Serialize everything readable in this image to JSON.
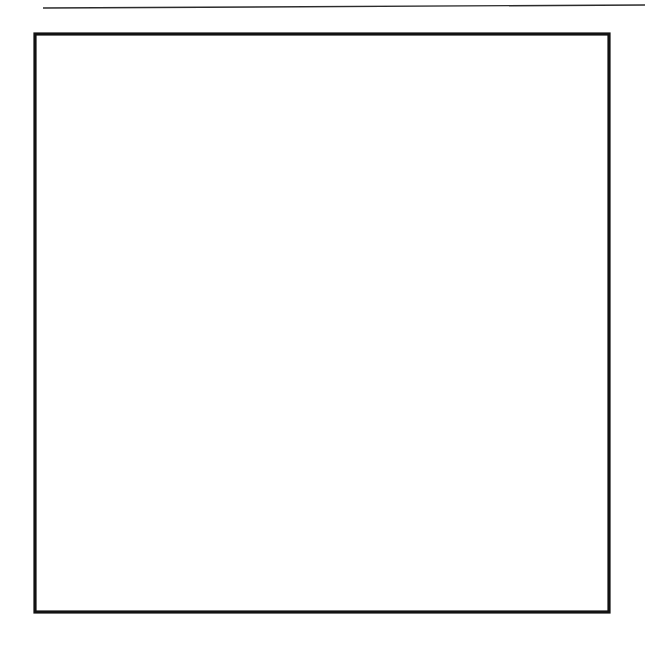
{
  "document": {
    "kind": "patent-style line drawing",
    "title": "Quilt block pattern diagram",
    "background_color": "#ffffff",
    "ink_color": "#111111"
  },
  "page_rule": {
    "name": "top horizontal rule",
    "x1": 43,
    "y1": 8,
    "x2": 645,
    "y2": 5,
    "color": "#2b2b2b"
  },
  "block": {
    "label": "quilt block",
    "x": 35,
    "y": 34,
    "width": 574,
    "height": 578,
    "outline_color": "#111111",
    "outline_width": 3.2,
    "columns": 4,
    "rows": 4
  },
  "grid": {
    "vertical_x": [
      178,
      320,
      463
    ],
    "horizontal_y": [
      325
    ],
    "color": "#1a1a1a"
  },
  "fills": {
    "dots": {
      "name": "dot-stipple",
      "spacing": 12,
      "dot_radius": 1.9,
      "color": "#111111",
      "background": "#ffffff"
    },
    "weave": {
      "name": "herringbone-hatch",
      "tile": 20,
      "color": "#111111",
      "background": "#ffffff"
    },
    "plain": {
      "name": "unshaded",
      "color": "#ffffff"
    }
  },
  "chart_data": {
    "type": "diagram",
    "units": "pixels",
    "block_bounds": {
      "left": 35,
      "top": 34,
      "right": 609,
      "bottom": 612
    },
    "cell_size": {
      "w": 143.5,
      "h": 144.5
    },
    "patches": [
      {
        "id": "tl-weave-up",
        "fill": "weave",
        "points": "35,180 178,34 178,325 35,325"
      },
      {
        "id": "tl-dots-up",
        "fill": "dots",
        "points": "178,34 320,180 320,325 178,325"
      },
      {
        "id": "tl-white-low",
        "fill": "plain",
        "points": "35,325 178,325 35,468"
      },
      {
        "id": "tr-weave-up",
        "fill": "weave",
        "points": "320,180 463,34 463,325 320,325"
      },
      {
        "id": "tr-dots-up",
        "fill": "dots",
        "points": "463,34 609,180 609,325 463,325"
      },
      {
        "id": "bl-dots-low",
        "fill": "dots",
        "points": "35,325 178,325 178,612 35,468"
      },
      {
        "id": "bl-weave-low",
        "fill": "weave",
        "points": "178,325 320,325 320,468 178,612"
      },
      {
        "id": "br-dots-low",
        "fill": "dots",
        "points": "320,325 463,325 463,612 320,468"
      },
      {
        "id": "br-weave-low",
        "fill": "weave",
        "points": "463,325 609,325 609,468 463,612"
      }
    ],
    "diagonals": [
      {
        "from": [
          35,
          180
        ],
        "to": [
          178,
          34
        ]
      },
      {
        "from": [
          178,
          34
        ],
        "to": [
          320,
          180
        ]
      },
      {
        "from": [
          320,
          180
        ],
        "to": [
          463,
          34
        ]
      },
      {
        "from": [
          463,
          34
        ],
        "to": [
          609,
          180
        ]
      },
      {
        "from": [
          35,
          325
        ],
        "to": [
          178,
          180
        ]
      },
      {
        "from": [
          178,
          325
        ],
        "to": [
          320,
          180
        ]
      },
      {
        "from": [
          320,
          325
        ],
        "to": [
          463,
          180
        ]
      },
      {
        "from": [
          463,
          325
        ],
        "to": [
          609,
          180
        ]
      },
      {
        "from": [
          35,
          325
        ],
        "to": [
          320,
          612
        ]
      },
      {
        "from": [
          320,
          325
        ],
        "to": [
          609,
          612
        ]
      },
      {
        "from": [
          35,
          468
        ],
        "to": [
          178,
          612
        ]
      },
      {
        "from": [
          320,
          468
        ],
        "to": [
          463,
          612
        ]
      },
      {
        "from": [
          178,
          612
        ],
        "to": [
          320,
          468
        ]
      },
      {
        "from": [
          463,
          612
        ],
        "to": [
          609,
          468
        ]
      }
    ],
    "legend": [
      {
        "label": "herringbone hatched patch",
        "fill": "weave"
      },
      {
        "label": "dot stippled patch",
        "fill": "dots"
      },
      {
        "label": "unshaded patch",
        "fill": "plain"
      }
    ]
  }
}
